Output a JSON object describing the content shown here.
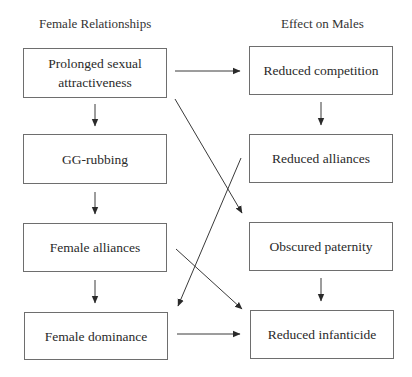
{
  "headers": {
    "left": "Female Relationships",
    "right": "Effect on Males"
  },
  "left_boxes": [
    {
      "id": "prolonged-sexual-attractiveness",
      "line1": "Prolonged sexual",
      "line2": "attractiveness"
    },
    {
      "id": "gg-rubbing",
      "label": "GG-rubbing"
    },
    {
      "id": "female-alliances",
      "label": "Female alliances"
    },
    {
      "id": "female-dominance",
      "label": "Female dominance"
    }
  ],
  "right_boxes": [
    {
      "id": "reduced-competition",
      "label": "Reduced competition"
    },
    {
      "id": "reduced-alliances",
      "label": "Reduced alliances"
    },
    {
      "id": "obscured-paternity",
      "label": "Obscured paternity"
    },
    {
      "id": "reduced-infanticide",
      "label": "Reduced infanticide"
    }
  ],
  "edges": [
    {
      "from": "prolonged-sexual-attractiveness",
      "to": "reduced-competition"
    },
    {
      "from": "prolonged-sexual-attractiveness",
      "to": "gg-rubbing"
    },
    {
      "from": "prolonged-sexual-attractiveness",
      "to": "obscured-paternity"
    },
    {
      "from": "gg-rubbing",
      "to": "female-alliances"
    },
    {
      "from": "female-alliances",
      "to": "female-dominance"
    },
    {
      "from": "female-alliances",
      "to": "reduced-infanticide"
    },
    {
      "from": "reduced-alliances",
      "to": "female-dominance"
    },
    {
      "from": "female-dominance",
      "to": "reduced-infanticide"
    },
    {
      "from": "reduced-competition",
      "to": "reduced-alliances"
    },
    {
      "from": "obscured-paternity",
      "to": "reduced-infanticide"
    }
  ],
  "colors": {
    "line": "#3a3a3a",
    "box_border": "#6e6e6e",
    "text": "#2a2a2a"
  }
}
